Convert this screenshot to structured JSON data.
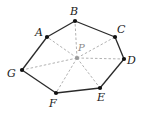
{
  "diagram": {
    "type": "heptagon-with-interior-point",
    "colors": {
      "edge": "#2a2a2a",
      "spoke": "#a8a8a8",
      "vertex": "#111111",
      "center": "#9a9a9a"
    },
    "vertices": [
      {
        "id": "A",
        "label": "A",
        "x": 47,
        "y": 37,
        "lx": 35,
        "ly": 36
      },
      {
        "id": "B",
        "label": "B",
        "x": 75,
        "y": 21,
        "lx": 70,
        "ly": 15
      },
      {
        "id": "C",
        "label": "C",
        "x": 115,
        "y": 37,
        "lx": 117,
        "ly": 33
      },
      {
        "id": "D",
        "label": "D",
        "x": 124,
        "y": 59,
        "lx": 127,
        "ly": 64
      },
      {
        "id": "E",
        "label": "E",
        "x": 100,
        "y": 88,
        "lx": 97,
        "ly": 101
      },
      {
        "id": "F",
        "label": "F",
        "x": 56,
        "y": 93,
        "lx": 49,
        "ly": 107
      },
      {
        "id": "G",
        "label": "G",
        "x": 22,
        "y": 70,
        "lx": 7,
        "ly": 77
      }
    ],
    "center": {
      "id": "P",
      "label": "P",
      "x": 77,
      "y": 58,
      "lx": 78,
      "ly": 51
    },
    "edges": [
      [
        "A",
        "B"
      ],
      [
        "B",
        "C"
      ],
      [
        "C",
        "D"
      ],
      [
        "D",
        "E"
      ],
      [
        "E",
        "F"
      ],
      [
        "F",
        "G"
      ],
      [
        "G",
        "A"
      ]
    ],
    "spokes": [
      "A",
      "B",
      "C",
      "D",
      "E",
      "F",
      "G"
    ]
  }
}
